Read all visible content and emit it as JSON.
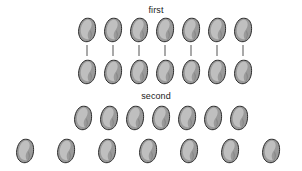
{
  "canvas": {
    "width": 302,
    "height": 171,
    "background": "#ffffff"
  },
  "style": {
    "bean_fill": "#9a9a9a",
    "bean_stroke": "#2b2b2b",
    "bean_highlight": "#d6d6d6",
    "bean_shadow": "#6e6e6e",
    "connector_color": "#555555",
    "label_color": "#1a1a1a"
  },
  "groups": [
    {
      "id": "group-first",
      "label": "first",
      "label_x": 156,
      "label_y": 5,
      "rows": [
        {
          "id": "first-top-row",
          "count": 7,
          "y": 17,
          "start_x": 77,
          "spacing": 26
        },
        {
          "id": "first-bottom-row",
          "count": 7,
          "y": 59,
          "start_x": 77,
          "spacing": 26
        }
      ],
      "connectors": {
        "count": 7,
        "start_x": 87,
        "spacing": 26,
        "y": 45,
        "length": 11
      }
    },
    {
      "id": "group-second",
      "label": "second",
      "label_x": 156,
      "label_y": 91,
      "rows": [
        {
          "id": "second-top-row",
          "count": 7,
          "y": 105,
          "start_x": 73,
          "spacing": 26
        },
        {
          "id": "second-bottom-row",
          "count": 7,
          "y": 138,
          "start_x": 15,
          "spacing": 41
        }
      ],
      "connectors": null
    }
  ],
  "totals": {
    "beans_first_top": 7,
    "beans_first_bottom": 7,
    "beans_second_top": 7,
    "beans_second_bottom": 7,
    "connectors_first": 7
  }
}
